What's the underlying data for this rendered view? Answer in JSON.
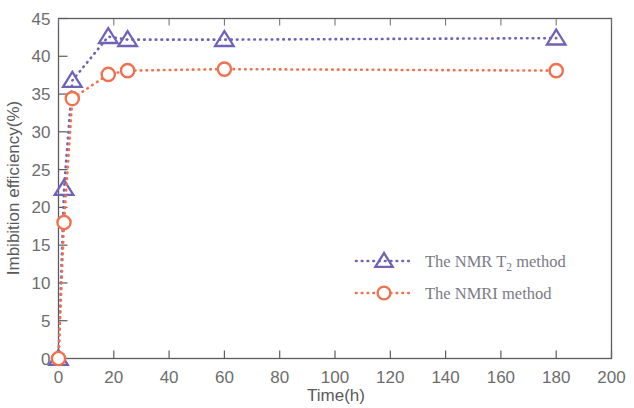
{
  "chart_data": {
    "type": "line",
    "title": "",
    "xlabel": "Time(h)",
    "ylabel": "Imbibition efficiency(%)",
    "xlim": [
      0,
      200
    ],
    "ylim": [
      0,
      45
    ],
    "xticks": [
      0,
      20,
      40,
      60,
      80,
      100,
      120,
      140,
      160,
      180,
      200
    ],
    "yticks": [
      0,
      5,
      10,
      15,
      20,
      25,
      30,
      35,
      40,
      45
    ],
    "grid": false,
    "legend_position": "center-right",
    "series": [
      {
        "name": "The NMR T2 method",
        "name_prefix": "The NMR T",
        "name_subscript": "2",
        "name_suffix": " method",
        "color": "#6f63b8",
        "marker": "triangle",
        "x": [
          0,
          2,
          5,
          18,
          25,
          60,
          180
        ],
        "y": [
          0,
          22.5,
          36.8,
          42.6,
          42.2,
          42.2,
          42.4
        ]
      },
      {
        "name": "The NMRI method",
        "name_prefix": "The NMRI method",
        "name_subscript": "",
        "name_suffix": "",
        "color": "#f0714f",
        "marker": "circle",
        "x": [
          0,
          2,
          5,
          18,
          25,
          60,
          180
        ],
        "y": [
          0,
          18.0,
          34.4,
          37.6,
          38.1,
          38.3,
          38.1
        ]
      }
    ]
  },
  "axes": {
    "x_tick_labels": [
      "0",
      "20",
      "40",
      "60",
      "80",
      "100",
      "120",
      "140",
      "160",
      "180",
      "200"
    ],
    "y_tick_labels": [
      "0",
      "5",
      "10",
      "15",
      "20",
      "25",
      "30",
      "35",
      "40",
      "45"
    ],
    "x_axis_title": "Time(h)",
    "y_axis_title": "Imbibition efficiency(%)"
  },
  "legend": {
    "entries": [
      {
        "prefix": "The NMR T",
        "subscript": "2",
        "suffix": " method",
        "marker": "triangle-marker",
        "color": "#6f63b8"
      },
      {
        "prefix": "The NMRI method",
        "subscript": "",
        "suffix": "",
        "marker": "circle-marker",
        "color": "#f0714f"
      }
    ]
  }
}
